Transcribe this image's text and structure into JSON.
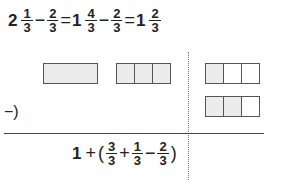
{
  "top_equation": {
    "term1": {
      "whole": "2",
      "num": "1",
      "den": "3"
    },
    "op1": "−",
    "term2": {
      "num": "2",
      "den": "3"
    },
    "eq1": "=",
    "term3": {
      "whole": "1",
      "num": "4",
      "den": "3"
    },
    "op2": "−",
    "term4": {
      "num": "2",
      "den": "3"
    },
    "eq2": "=",
    "result": {
      "whole": "1",
      "num": "2",
      "den": "3"
    }
  },
  "diagram": {
    "minuend_row": [
      {
        "name": "whole-bar",
        "cells": [
          true
        ]
      },
      {
        "name": "thirds-bar-full",
        "cells": [
          true,
          true,
          true
        ]
      },
      {
        "name": "thirds-bar-one",
        "cells": [
          true,
          false,
          false
        ]
      }
    ],
    "subtrahend_row": [
      {
        "name": "thirds-bar-two",
        "cells": [
          true,
          true,
          false
        ]
      }
    ],
    "subtraction_marker": "−)",
    "shade_color": "#ececec",
    "border_color": "#555555"
  },
  "bottom_expression": {
    "whole": "1",
    "plus": "+",
    "open_paren": "(",
    "f1": {
      "num": "3",
      "den": "3"
    },
    "plus2": "+",
    "f2": {
      "num": "1",
      "den": "3"
    },
    "minus": "−",
    "f3": {
      "num": "2",
      "den": "3"
    },
    "close_paren": ")"
  }
}
